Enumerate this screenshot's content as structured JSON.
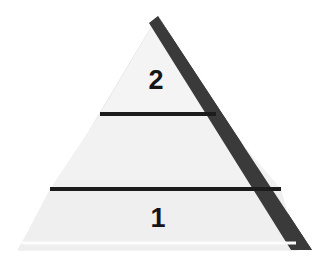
{
  "diagram": {
    "kind": "pyramid-diagram",
    "title": "",
    "background_color": "#ffffff",
    "body_fill_color": "#f1f1f1",
    "body_fill_color_lower": "#ededed",
    "shadow_color": "#3a3a3a",
    "divider_color": "#1c1c1c",
    "outline_color": "#e2e2e2",
    "label_color": "#151515",
    "apex": {
      "x": 158,
      "y": 16
    },
    "base_left": {
      "x": 18,
      "y": 250
    },
    "base_right": {
      "x": 298,
      "y": 250
    },
    "shadow_base_right": {
      "x": 312,
      "y": 250
    },
    "tiers": [
      {
        "id": "tier-top",
        "label": "2",
        "position": "top",
        "label_x": 156,
        "label_y": 81
      },
      {
        "id": "tier-middle",
        "label": "",
        "position": "middle",
        "label_x": 158,
        "label_y": 152
      },
      {
        "id": "tier-bottom",
        "label": "1",
        "position": "bottom",
        "label_x": 158,
        "label_y": 219
      }
    ],
    "dividers": [
      {
        "id": "divider-upper",
        "y": 114,
        "x_start": 100,
        "x_end": 216,
        "thickness": 4
      },
      {
        "id": "divider-lower",
        "y": 189,
        "x_start": 50,
        "x_end": 281,
        "thickness": 4
      }
    ],
    "base_highlight": {
      "id": "base-highlight-line",
      "y": 243,
      "x_start": 22,
      "x_end": 296,
      "color": "#fbfbfb"
    }
  }
}
